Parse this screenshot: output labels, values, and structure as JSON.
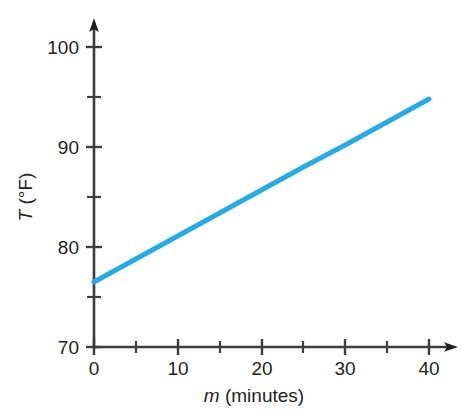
{
  "chart_data": {
    "type": "line",
    "title": "",
    "subtitle": "",
    "xlabel": "m (minutes)",
    "xlabel_variable": "m",
    "xlabel_unit": "(minutes)",
    "ylabel": "T (°F)",
    "ylabel_variable": "T",
    "ylabel_unit": "(°F)",
    "xlim": [
      0,
      40
    ],
    "ylim": [
      70,
      100
    ],
    "x_major_ticks": [
      0,
      10,
      20,
      30,
      40
    ],
    "x_minor_ticks": [
      5,
      15,
      25,
      35
    ],
    "x_tick_labels": [
      "0",
      "10",
      "20",
      "30",
      "40"
    ],
    "y_major_ticks": [
      70,
      80,
      90,
      100
    ],
    "y_minor_ticks": [
      75,
      85,
      95
    ],
    "y_tick_labels": [
      "70",
      "80",
      "90",
      "100"
    ],
    "grid": false,
    "legend": false,
    "legend_position": "none",
    "axis_arrows": {
      "x": "right",
      "y": "up"
    },
    "series": [
      {
        "name": "Temperature",
        "color": "#29abe2",
        "line_width": 5,
        "x": [
          0,
          5,
          10,
          15,
          20,
          25,
          30,
          35,
          40
        ],
        "values": [
          76.5,
          78.8,
          81.1,
          83.4,
          85.7,
          88.0,
          90.2,
          92.5,
          94.8
        ],
        "endpoints": {
          "start": [
            0,
            76.5
          ],
          "end": [
            40,
            94.8
          ]
        },
        "slope": 0.4575,
        "intercept": 76.5
      }
    ]
  },
  "colors": {
    "line": "#29abe2",
    "axis": "#3f3c3d",
    "text": "#231f20",
    "background": "#ffffff"
  },
  "axes": {
    "x_title": "m (minutes)",
    "x_title_var": "m",
    "x_title_rest": " (minutes)",
    "y_title": "T (°F)",
    "y_title_var": "T",
    "y_title_rest": " (°F)",
    "x_labels": [
      "0",
      "10",
      "20",
      "30",
      "40"
    ],
    "y_labels": [
      "70",
      "80",
      "90",
      "100"
    ]
  }
}
